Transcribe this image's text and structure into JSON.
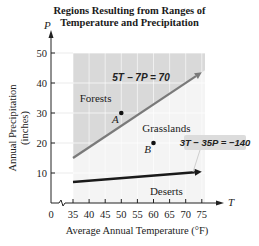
{
  "chart_data": {
    "type": "line",
    "title_lines": [
      "Regions Resulting from Ranges of",
      "Temperature and Precipitation"
    ],
    "xlabel": "Average Annual Temperature (°F)",
    "ylabel_lines": [
      "Annual Precipitation",
      "(inches)"
    ],
    "x_axis_var": "T",
    "y_axis_var": "P",
    "xlim": [
      35,
      77
    ],
    "ylim": [
      0,
      55
    ],
    "x_ticks": [
      35,
      40,
      45,
      50,
      55,
      60,
      65,
      70,
      75
    ],
    "x_tick_labels": [
      "35",
      "40",
      "45",
      "50",
      "55",
      "60",
      "65",
      "70",
      "75"
    ],
    "x_origin_label": "0",
    "x_axis_break": true,
    "y_ticks": [
      10,
      20,
      30,
      40,
      50
    ],
    "y_tick_labels": [
      "10",
      "20",
      "30",
      "40",
      "50"
    ],
    "grid": true,
    "series": [
      {
        "name": "5T − 7P = 70",
        "x": [
          35,
          75
        ],
        "y": [
          15,
          43.57
        ],
        "color": "#7a7a7a"
      },
      {
        "name": "3T − 35P = −140",
        "x": [
          35,
          75
        ],
        "y": [
          7,
          10.43
        ],
        "color": "#1a1a1a"
      }
    ],
    "points": [
      {
        "label": "A",
        "x": 50,
        "y": 30
      },
      {
        "label": "B",
        "x": 60,
        "y": 20
      }
    ],
    "regions": [
      {
        "label": "Forests",
        "x": 42,
        "y": 35
      },
      {
        "label": "Grasslands",
        "x": 64,
        "y": 25
      },
      {
        "label": "Deserts",
        "x": 64,
        "y": 4
      }
    ],
    "region_fill": {
      "shaded": "#d9d9d9",
      "light": "#f4f4f4"
    }
  }
}
